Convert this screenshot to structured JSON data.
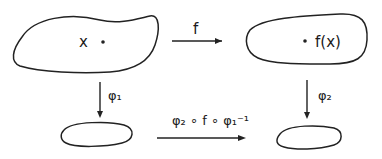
{
  "diagram": {
    "top_left": {
      "point_label": "x"
    },
    "top_right": {
      "point_label": "f(x)"
    },
    "arrows": {
      "top": {
        "label": "f"
      },
      "left_down": {
        "label": "φ₁"
      },
      "right_down": {
        "label": "φ₂"
      },
      "bottom": {
        "label": "φ₂ ∘ f ∘ φ₁⁻¹"
      }
    }
  }
}
